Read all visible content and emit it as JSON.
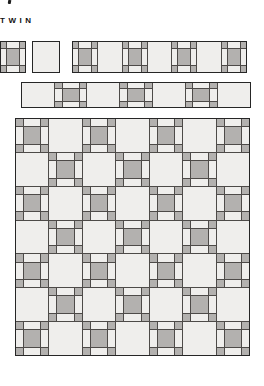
{
  "header": {
    "title": "TWIN"
  },
  "colors": {
    "patch_dark": "#b3b1af",
    "patch_light": "#efeeec",
    "grid_line": "#4d4a48",
    "outline": "#262626",
    "background": "#ffffff"
  },
  "diagram": {
    "pieced_block": "nine-patch-chain-block",
    "plain_block": "plain-setting-block",
    "row_a": [
      "pieced",
      "plain",
      "pieced",
      "plain",
      "pieced",
      "plain",
      "pieced"
    ],
    "row_b": [
      "plain",
      "pieced",
      "plain",
      "pieced",
      "plain",
      "pieced",
      "plain"
    ],
    "quilt": {
      "rows": 7,
      "cols": 7,
      "start": "pieced"
    }
  }
}
